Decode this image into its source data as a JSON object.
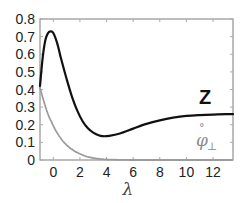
{
  "chart_data": {
    "type": "line",
    "title": "",
    "xlabel": "λ",
    "ylabel": "",
    "xlim": [
      -1,
      13.5
    ],
    "ylim": [
      0,
      0.8
    ],
    "grid": false,
    "legend": "inline labels near curve ends",
    "x_ticks": [
      0,
      2,
      4,
      6,
      8,
      10,
      12
    ],
    "x_tick_labels": [
      "0",
      "2",
      "4",
      "6",
      "8",
      "10",
      "12"
    ],
    "y_ticks": [
      0,
      0.1,
      0.2,
      0.3,
      0.4,
      0.5,
      0.6,
      0.7,
      0.8
    ],
    "y_tick_labels": [
      "0",
      "0.1",
      "0.2",
      "0.3",
      "0.4",
      "0.5",
      "0.6",
      "0.7",
      "0.8"
    ],
    "series": [
      {
        "name": "Z",
        "label": "Z",
        "color": "#111111",
        "style": "solid",
        "width": 2.2,
        "x": [
          -1.0,
          -0.8,
          -0.6,
          -0.4,
          -0.2,
          0.0,
          0.3,
          0.6,
          1.0,
          1.4,
          1.8,
          2.2,
          2.6,
          3.0,
          3.4,
          3.7,
          4.2,
          5.0,
          6.0,
          7.0,
          8.0,
          9.0,
          10.0,
          11.0,
          12.0,
          13.0,
          13.5
        ],
        "y": [
          0.42,
          0.58,
          0.68,
          0.72,
          0.73,
          0.72,
          0.66,
          0.57,
          0.46,
          0.36,
          0.28,
          0.22,
          0.18,
          0.155,
          0.14,
          0.135,
          0.137,
          0.15,
          0.178,
          0.205,
          0.225,
          0.24,
          0.25,
          0.255,
          0.258,
          0.26,
          0.26
        ]
      },
      {
        "name": "phi_perp_ring",
        "label": "φ̊⊥",
        "color": "#9a9a9a",
        "style": "dotted",
        "width": 1.8,
        "x": [
          -1.0,
          -0.7,
          -0.4,
          -0.1,
          0.2,
          0.5,
          0.8,
          1.2,
          1.6,
          2.0,
          2.5,
          3.0,
          3.5,
          4.0,
          5.0,
          6.0,
          8.0,
          10.0,
          12.0,
          13.5
        ],
        "y": [
          0.41,
          0.33,
          0.26,
          0.21,
          0.165,
          0.13,
          0.1,
          0.072,
          0.05,
          0.035,
          0.02,
          0.011,
          0.006,
          0.003,
          0.001,
          0.0,
          0.0,
          0.0,
          0.0,
          0.0
        ]
      }
    ],
    "annotations": [
      {
        "text": "Z",
        "x": 12.0,
        "y": 0.33
      },
      {
        "text": "φ̊⊥",
        "x": 11.0,
        "y": 0.09
      }
    ]
  },
  "labels": {
    "xlabel": "λ",
    "z": "Z",
    "phi": "φ",
    "phi_ring": "°",
    "phi_sub": "⊥"
  }
}
